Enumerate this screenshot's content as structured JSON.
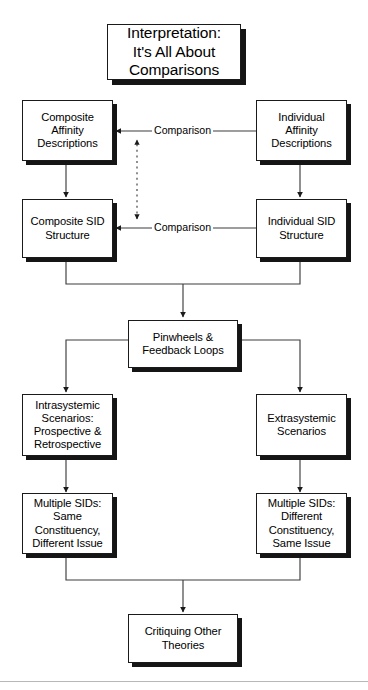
{
  "figure": {
    "kind": "flowchart",
    "title_box": {
      "id": "interpretation-title",
      "text": "Interpretation:\nIt's All About\nComparisons"
    },
    "nodes": [
      {
        "id": "composite-affinity-descriptions",
        "text": "Composite\nAffinity\nDescriptions"
      },
      {
        "id": "individual-affinity-descriptions",
        "text": "Individual\nAffinity\nDescriptions"
      },
      {
        "id": "composite-sid-structure",
        "text": "Composite SID\nStructure"
      },
      {
        "id": "individual-sid-structure",
        "text": "Individual SID\nStructure"
      },
      {
        "id": "pinwheels-feedback-loops",
        "text": "Pinwheels &\nFeedback Loops"
      },
      {
        "id": "intrasystemic-scenarios",
        "text": "Intrasystemic\nScenarios:\nProspective &\nRetrospective"
      },
      {
        "id": "extrasystemic-scenarios",
        "text": "Extrasystemic\nScenarios"
      },
      {
        "id": "multiple-sids-same-constituency",
        "text": "Multiple SIDs:\nSame\nConstituency,\nDifferent Issue"
      },
      {
        "id": "multiple-sids-different-constituency",
        "text": "Multiple SIDs:\nDifferent\nConstituency,\nSame Issue"
      },
      {
        "id": "critiquing-other-theories",
        "text": "Critiquing Other\nTheories"
      }
    ],
    "edge_labels": [
      {
        "id": "comparison-affinity",
        "text": "Comparison"
      },
      {
        "id": "comparison-sid",
        "text": "Comparison"
      }
    ],
    "colors": {
      "line": "#1a1a1a",
      "box_border": "#1a1a1a",
      "box_fill": "#ffffff",
      "box_shadow": "#151515",
      "thin_connector": "#4a4a4a",
      "page_rule": "#b8b8b8"
    }
  }
}
